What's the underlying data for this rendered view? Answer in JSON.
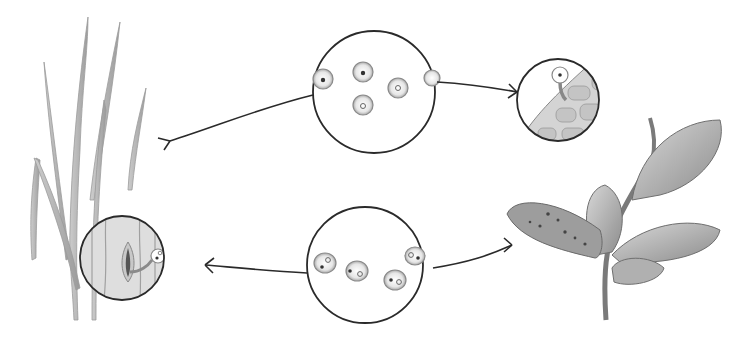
{
  "diagram": {
    "type": "life-cycle",
    "background": "#ffffff",
    "stroke_color": "#2a2a2a",
    "shade_color": "#9a9a9a",
    "nodes": [
      {
        "id": "grass-host",
        "label": "",
        "depiction": "grass blades (host plant)"
      },
      {
        "id": "grass-stomata-magnified",
        "label": "",
        "depiction": "magnified grass leaf with spore germ tube entering stoma"
      },
      {
        "id": "spores-top",
        "label": "",
        "depiction": "magnified circle with five round spores"
      },
      {
        "id": "leaf-cells-magnified",
        "label": "",
        "depiction": "magnified leaf cells with spore germ tube penetrating"
      },
      {
        "id": "broadleaf-host",
        "label": "",
        "depiction": "broadleaf plant with spotted infected leaf"
      },
      {
        "id": "spores-bottom",
        "label": "",
        "depiction": "magnified circle with four binucleate spores"
      }
    ],
    "edges": [
      {
        "from": "spores-top",
        "to": "grass-host",
        "direction": "left"
      },
      {
        "from": "spores-top",
        "to": "leaf-cells-magnified",
        "direction": "right"
      },
      {
        "from": "broadleaf-host",
        "to": "spores-bottom",
        "direction": "left"
      },
      {
        "from": "spores-bottom",
        "to": "grass-stomata-magnified",
        "direction": "left"
      }
    ]
  }
}
